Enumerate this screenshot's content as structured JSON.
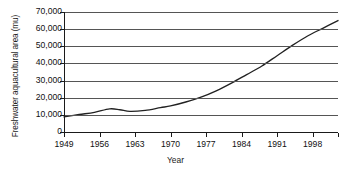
{
  "chart_data": {
    "type": "line",
    "title": "",
    "xlabel": "Year",
    "ylabel": "Freshwater aquacultural area (mu)",
    "xlim": [
      1949,
      2003
    ],
    "ylim": [
      0,
      70000
    ],
    "grid": true,
    "legend": "none",
    "y_ticks": [
      70000,
      60000,
      50000,
      40000,
      30000,
      20000,
      10000,
      0
    ],
    "y_tick_labels": [
      "70,000",
      "60,000",
      "50,000",
      "40,000",
      "30,000",
      "20,000",
      "10,000",
      "0"
    ],
    "x_ticks": [
      1949,
      1956,
      1963,
      1970,
      1977,
      1984,
      1991,
      1998
    ],
    "x_tick_labels": [
      "1949",
      "1956",
      "1963",
      "1970",
      "1977",
      "1984",
      "1991",
      "1998"
    ],
    "series": [
      {
        "name": "Freshwater aquacultural area",
        "color": "#222222",
        "x": [
          1949,
          1952,
          1955,
          1958,
          1960,
          1962,
          1965,
          1968,
          1970,
          1973,
          1976,
          1979,
          1982,
          1985,
          1988,
          1991,
          1994,
          1997,
          2000,
          2003
        ],
        "values": [
          8800,
          10200,
          11500,
          13500,
          13000,
          12000,
          12600,
          14200,
          15200,
          17500,
          20300,
          24000,
          28500,
          33500,
          38500,
          44500,
          50500,
          56000,
          60500,
          65000
        ]
      }
    ]
  }
}
